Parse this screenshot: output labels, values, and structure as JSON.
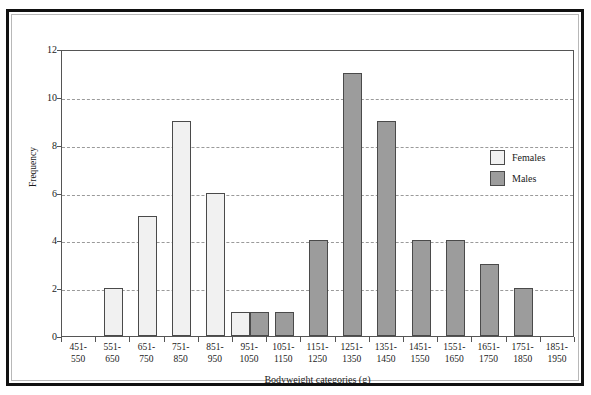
{
  "chart_data": {
    "type": "bar",
    "title": "",
    "xlabel": "Bodyweight categories (g)",
    "ylabel": "Frequency",
    "ylim": [
      0,
      12
    ],
    "yticks": [
      0,
      2,
      4,
      6,
      8,
      10,
      12
    ],
    "grid": "horizontal-dashed",
    "legend_position": "inside-upper-right",
    "categories": [
      "451-\n550",
      "551-\n650",
      "651-\n750",
      "751-\n850",
      "851-\n950",
      "951-\n1050",
      "1051-\n1150",
      "1151-\n1250",
      "1251-\n1350",
      "1351-\n1450",
      "1451-\n1550",
      "1551-\n1650",
      "1651-\n1750",
      "1751-\n1850",
      "1851-\n1950"
    ],
    "category_parts": [
      {
        "top": "451-",
        "bottom": "550"
      },
      {
        "top": "551-",
        "bottom": "650"
      },
      {
        "top": "651-",
        "bottom": "750"
      },
      {
        "top": "751-",
        "bottom": "850"
      },
      {
        "top": "851-",
        "bottom": "950"
      },
      {
        "top": "951-",
        "bottom": "1050"
      },
      {
        "top": "1051-",
        "bottom": "1150"
      },
      {
        "top": "1151-",
        "bottom": "1250"
      },
      {
        "top": "1251-",
        "bottom": "1350"
      },
      {
        "top": "1351-",
        "bottom": "1450"
      },
      {
        "top": "1451-",
        "bottom": "1550"
      },
      {
        "top": "1551-",
        "bottom": "1650"
      },
      {
        "top": "1651-",
        "bottom": "1750"
      },
      {
        "top": "1751-",
        "bottom": "1850"
      },
      {
        "top": "1851-",
        "bottom": "1950"
      }
    ],
    "series": [
      {
        "name": "Females",
        "color": "#f1f1f1",
        "edge_color": "#4a4a4a",
        "values": [
          0,
          2,
          5,
          9,
          6,
          1,
          0,
          0,
          0,
          0,
          0,
          0,
          0,
          0,
          0
        ]
      },
      {
        "name": "Males",
        "color": "#9c9c9c",
        "edge_color": "#4a4a4a",
        "values": [
          0,
          0,
          0,
          0,
          0,
          1,
          1,
          4,
          11,
          9,
          4,
          4,
          3,
          2,
          0
        ]
      }
    ]
  },
  "legend": {
    "entries": [
      {
        "label": "Females",
        "swatch": "female"
      },
      {
        "label": "Males",
        "swatch": "male"
      }
    ]
  },
  "axes": {
    "y_title": "Frequency",
    "x_title": "Bodyweight categories (g)",
    "y_tick_labels": [
      "0",
      "2",
      "4",
      "6",
      "8",
      "10",
      "12"
    ]
  }
}
